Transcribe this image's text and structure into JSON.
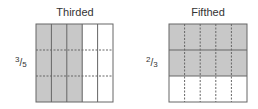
{
  "diagrams": [
    {
      "title": "Thirded",
      "fraction": {
        "numerator": "3",
        "denominator": "5"
      },
      "columns": 5,
      "shaded_columns": 3,
      "dashed_rows": 3
    },
    {
      "title": "Fifthed",
      "fraction": {
        "numerator": "2",
        "denominator": "3"
      },
      "rows": 3,
      "shaded_rows": 2,
      "dashed_columns": 5
    }
  ],
  "colors": {
    "shade": "#c8c8c8",
    "line": "#666666",
    "dashed": "#666666"
  }
}
